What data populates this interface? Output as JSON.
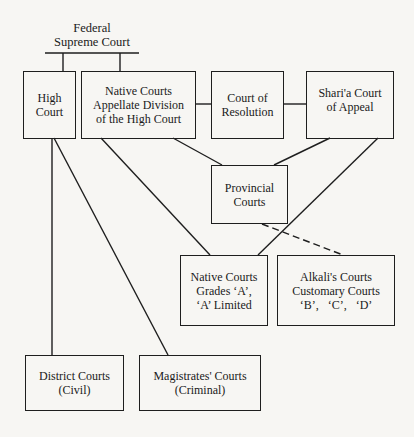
{
  "diagram": {
    "type": "hierarchy",
    "top": {
      "line1": "Federal",
      "line2": "Supreme Court"
    },
    "nodes": {
      "high_court": {
        "line1": "High",
        "line2": "Court"
      },
      "native_appellate": {
        "line1": "Native Courts",
        "line2": "Appellate Division",
        "line3": "of the High Court"
      },
      "court_of_resolution": {
        "line1": "Court of",
        "line2": "Resolution"
      },
      "sharia_appeal": {
        "line1": "Shari'a Court",
        "line2": "of Appeal"
      },
      "provincial": {
        "line1": "Provincial",
        "line2": "Courts"
      },
      "native_grades": {
        "line1": "Native Courts",
        "line2": "Grades ‘A’,",
        "line3": "‘A’ Limited"
      },
      "alkali": {
        "line1": "Alkali's Courts",
        "line2": "Customary Courts",
        "line3": "‘B’,   ‘C’,   ‘D’"
      },
      "district": {
        "line1": "District Courts",
        "line2": "(Civil)"
      },
      "magistrates": {
        "line1": "Magistrates' Courts",
        "line2": "(Criminal)"
      }
    },
    "edges": [
      {
        "from": "Federal Supreme Court",
        "to": "High Court",
        "style": "solid"
      },
      {
        "from": "Federal Supreme Court",
        "to": "Native Courts Appellate Division of the High Court",
        "style": "solid"
      },
      {
        "from": "Native Courts Appellate Division of the High Court",
        "to": "Court of Resolution",
        "style": "solid"
      },
      {
        "from": "Court of Resolution",
        "to": "Shari'a Court of Appeal",
        "style": "solid"
      },
      {
        "from": "High Court",
        "to": "District Courts (Civil)",
        "style": "solid"
      },
      {
        "from": "High Court",
        "to": "Magistrates' Courts (Criminal)",
        "style": "solid"
      },
      {
        "from": "Native Courts Appellate Division of the High Court",
        "to": "Native Courts Grades 'A', 'A' Limited",
        "style": "solid"
      },
      {
        "from": "Native Courts Appellate Division of the High Court",
        "to": "Provincial Courts",
        "style": "solid"
      },
      {
        "from": "Shari'a Court of Appeal",
        "to": "Provincial Courts",
        "style": "solid"
      },
      {
        "from": "Shari'a Court of Appeal",
        "to": "Native Courts Grades 'A', 'A' Limited",
        "style": "solid"
      },
      {
        "from": "Provincial Courts",
        "to": "Alkali's Courts Customary Courts 'B', 'C', 'D'",
        "style": "dashed"
      }
    ]
  }
}
